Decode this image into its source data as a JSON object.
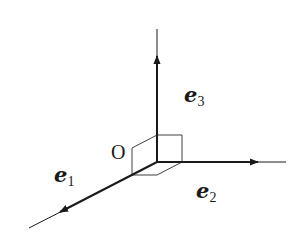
{
  "diagram": {
    "type": "3d-orthonormal-basis",
    "colors": {
      "stroke": "#1a1a1a",
      "background": "#ffffff"
    },
    "origin": {
      "label": "O",
      "x": 157,
      "y": 162
    },
    "axes": [
      {
        "id": "e1",
        "base": "e",
        "subscript": "1",
        "tip": [
          60,
          212
        ],
        "end": [
          29,
          228
        ],
        "label_pos": [
          54,
          182
        ]
      },
      {
        "id": "e2",
        "base": "e",
        "subscript": "2",
        "tip": [
          258,
          162
        ],
        "end": [
          286,
          162
        ],
        "label_pos": [
          196,
          198
        ]
      },
      {
        "id": "e3",
        "base": "e",
        "subscript": "3",
        "tip": [
          157,
          56
        ],
        "end": [
          157,
          29
        ],
        "label_pos": [
          184,
          102
        ]
      }
    ]
  }
}
